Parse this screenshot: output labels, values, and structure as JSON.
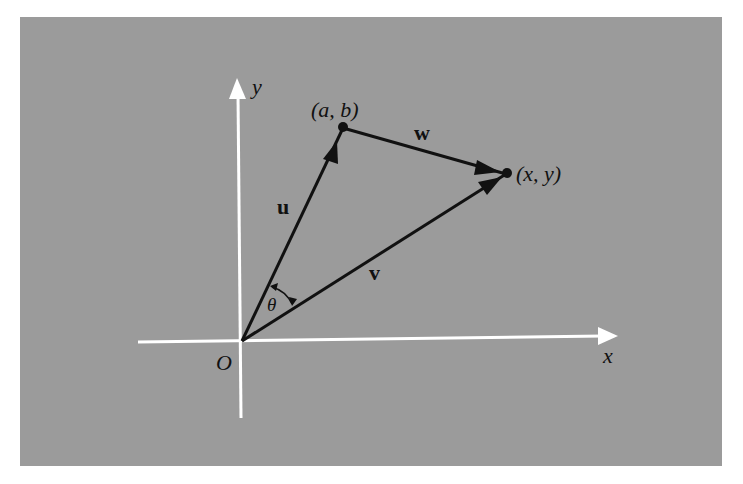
{
  "diagram": {
    "colors": {
      "background": "#ffffff",
      "panel": "#9b9b9b",
      "axes": "#ffffff",
      "vectors": "#111111",
      "text": "#111111"
    },
    "axes": {
      "x_label": "x",
      "y_label": "y",
      "origin_label": "O"
    },
    "points": {
      "ab": {
        "label": "(a, b)",
        "a": "a",
        "b": "b"
      },
      "xy": {
        "label": "(x, y)",
        "x": "x",
        "y": "y"
      }
    },
    "vectors": {
      "u": {
        "label": "u",
        "from": "O",
        "to": "(a, b)"
      },
      "v": {
        "label": "v",
        "from": "O",
        "to": "(x, y)"
      },
      "w": {
        "label": "w",
        "from": "(a, b)",
        "to": "(x, y)"
      }
    },
    "angle": {
      "label": "θ",
      "between": [
        "u",
        "v"
      ]
    }
  }
}
